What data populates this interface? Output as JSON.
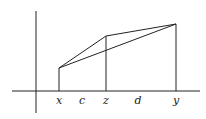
{
  "diagram": {
    "type": "geometric-figure",
    "axes": {
      "horizontal": {
        "x1": 12,
        "x2": 200,
        "y": 91
      },
      "vertical": {
        "x": 36,
        "y1": 11,
        "y2": 113
      }
    },
    "points": {
      "left": {
        "x": 59,
        "y": 68
      },
      "middle": {
        "x": 106,
        "y": 36
      },
      "right": {
        "x": 176,
        "y": 24
      }
    },
    "labels": [
      {
        "id": "x",
        "text": "x",
        "px": 59,
        "py": 96
      },
      {
        "id": "c",
        "text": "c",
        "px": 82,
        "py": 96
      },
      {
        "id": "z",
        "text": "z",
        "px": 106,
        "py": 96
      },
      {
        "id": "d",
        "text": "d",
        "px": 138,
        "py": 96
      },
      {
        "id": "y",
        "text": "y",
        "px": 176,
        "py": 96
      }
    ],
    "stroke_color": "#222222"
  }
}
